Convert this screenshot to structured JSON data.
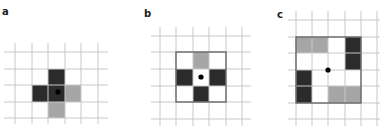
{
  "panels": [
    {
      "label": "a",
      "label_pos": [
        2,
        7
      ],
      "grid": {
        "x_lines": [
          15,
          32,
          48,
          65,
          81,
          98
        ],
        "y_lines": [
          52,
          69,
          85,
          102,
          118
        ],
        "x_range": [
          4,
          108
        ],
        "y_range": [
          43,
          124
        ]
      },
      "outline": null,
      "cells": [
        {
          "x": 48,
          "y": 69,
          "w": 17,
          "h": 16,
          "shade": "dark"
        },
        {
          "x": 32,
          "y": 85,
          "w": 33,
          "h": 17,
          "shade": "dark"
        },
        {
          "x": 65,
          "y": 85,
          "w": 16,
          "h": 17,
          "shade": "gray"
        },
        {
          "x": 48,
          "y": 102,
          "w": 17,
          "h": 16,
          "shade": "gray"
        }
      ],
      "dot": {
        "x": 58,
        "y": 92
      }
    },
    {
      "label": "b",
      "label_pos": [
        144,
        9
      ],
      "grid": {
        "x_lines": [
          160,
          176,
          193,
          209,
          226,
          242
        ],
        "y_lines": [
          36,
          52,
          69,
          86,
          102,
          119
        ],
        "x_range": [
          151,
          251
        ],
        "y_range": [
          27,
          126
        ]
      },
      "outline": {
        "x": 176,
        "y": 52,
        "w": 50,
        "h": 50
      },
      "cells": [
        {
          "x": 193,
          "y": 52,
          "w": 16,
          "h": 17,
          "shade": "gray"
        },
        {
          "x": 176,
          "y": 69,
          "w": 17,
          "h": 17,
          "shade": "dark"
        },
        {
          "x": 209,
          "y": 69,
          "w": 17,
          "h": 17,
          "shade": "dark"
        },
        {
          "x": 193,
          "y": 86,
          "w": 16,
          "h": 16,
          "shade": "dark"
        }
      ],
      "dot": {
        "x": 201,
        "y": 77
      }
    },
    {
      "label": "c",
      "label_pos": [
        277,
        10
      ],
      "grid": {
        "x_lines": [
          296,
          312,
          328,
          345,
          361,
          377
        ],
        "y_lines": [
          20,
          37,
          53,
          70,
          86,
          103,
          119
        ],
        "x_range": [
          288,
          380
        ],
        "y_range": [
          11,
          126
        ]
      },
      "outline": {
        "x": 296,
        "y": 37,
        "w": 65,
        "h": 66
      },
      "cells": [
        {
          "x": 296,
          "y": 37,
          "w": 32,
          "h": 16,
          "shade": "gray"
        },
        {
          "x": 345,
          "y": 37,
          "w": 16,
          "h": 33,
          "shade": "dark"
        },
        {
          "x": 296,
          "y": 70,
          "w": 16,
          "h": 33,
          "shade": "dark"
        },
        {
          "x": 328,
          "y": 86,
          "w": 33,
          "h": 17,
          "shade": "gray"
        }
      ],
      "dot": {
        "x": 328,
        "y": 70
      }
    }
  ],
  "colors": {
    "grid": "#c8c8c8",
    "outline": "#555555",
    "dark": "#2b2b2b",
    "gray": "#a6a6a6",
    "dot": "#000000"
  }
}
